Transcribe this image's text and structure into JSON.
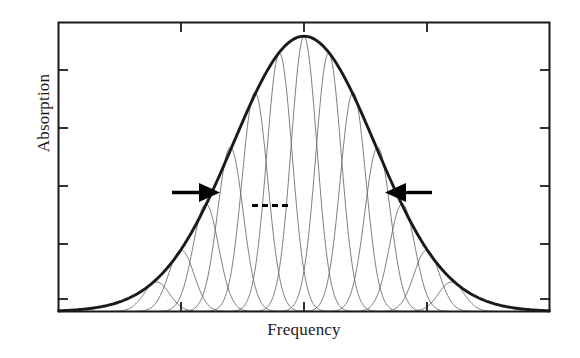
{
  "figure": {
    "ylabel": "Absorption",
    "xlabel": "Frequency"
  },
  "colors": {
    "envelope": "#1a1a1a",
    "component": "#707070",
    "frame": "#1a1a1a",
    "arrow": "#000000",
    "dashed": "#000000",
    "background": "#ffffff"
  },
  "chart_data": {
    "type": "line",
    "title": "",
    "xlabel": "Frequency",
    "ylabel": "Absorption",
    "xlim": [
      0,
      100
    ],
    "ylim": [
      0,
      1.05
    ],
    "grid": false,
    "legend": null,
    "xticks": [
      25,
      50,
      75
    ],
    "xticklabels": [
      "",
      "",
      ""
    ],
    "yticks": [
      0.2,
      0.4,
      0.6,
      0.8,
      1.0
    ],
    "yticklabels": [
      "",
      "",
      "",
      "",
      ""
    ],
    "series": [
      {
        "name": "inhomogeneous envelope",
        "role": "envelope",
        "linewidth": "thick",
        "gaussian": {
          "center": 50,
          "sigma": 14.5,
          "amplitude": 1.0
        }
      },
      {
        "name": "homogeneous components",
        "role": "components",
        "linewidth": "thin",
        "count": 13,
        "component_sigma": 2.6,
        "centers": [
          20,
          25,
          30,
          35,
          40,
          45,
          50,
          55,
          60,
          65,
          70,
          75,
          80
        ],
        "amplitudes": [
          0.107,
          0.223,
          0.391,
          0.597,
          0.797,
          0.939,
          1.0,
          0.939,
          0.797,
          0.597,
          0.391,
          0.223,
          0.107
        ]
      }
    ],
    "annotations": [
      {
        "name": "inhomogeneous-width-arrow-left",
        "type": "arrow",
        "direction": "right",
        "x_start": 23.2,
        "x_end": 32.6,
        "y": 0.59
      },
      {
        "name": "inhomogeneous-width-arrow-right",
        "type": "arrow",
        "direction": "left",
        "x_start": 76.2,
        "x_end": 66.9,
        "y": 0.59
      },
      {
        "name": "homogeneous-width-dashed-marker",
        "type": "dashed-segment",
        "x_start": 39.5,
        "x_end": 46.8,
        "y": 0.455,
        "dashes": 4
      }
    ]
  }
}
